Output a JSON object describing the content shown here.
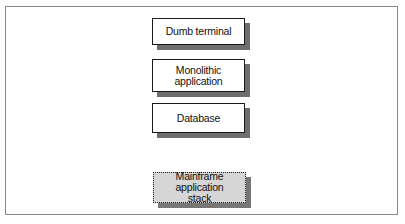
{
  "diagram": {
    "type": "layered-stack",
    "layers": [
      {
        "label": "Dumb terminal"
      },
      {
        "label": "Monolithic\napplication"
      },
      {
        "label": "Database"
      }
    ],
    "stack_label": {
      "label": "Mainframe application\nstack"
    },
    "colors": {
      "layer_fill": "#ffffff",
      "layer_border": "#1a1a1a",
      "shadow": "#6e6e6e",
      "stack_fill": "#d6d6d6",
      "frame_border": "#8a8a8a"
    }
  }
}
